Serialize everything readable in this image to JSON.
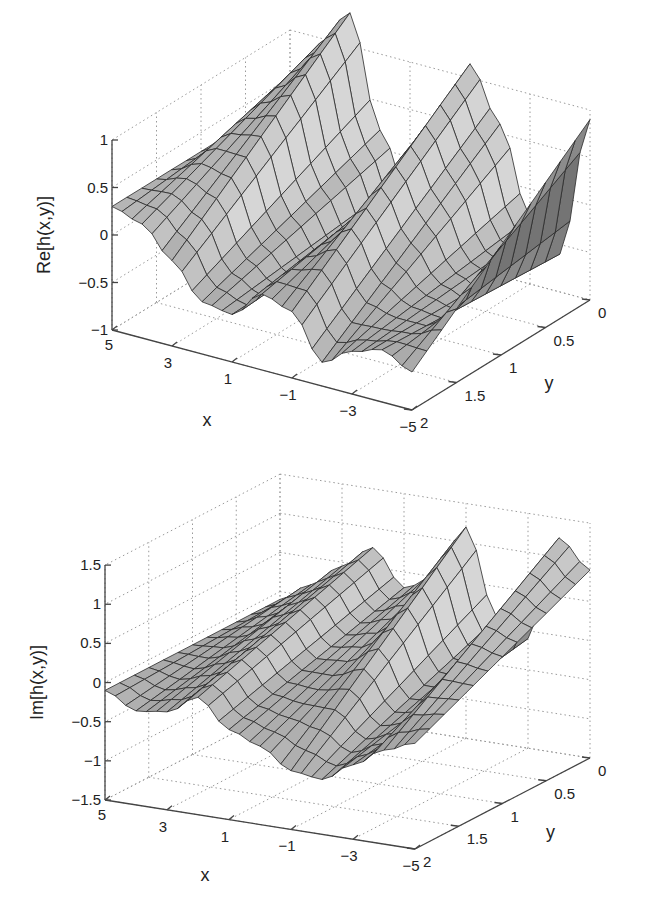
{
  "chart_data": [
    {
      "type": "surface",
      "title": "",
      "xlabel": "x",
      "ylabel": "y",
      "zlabel": "Re[h(x,y)]",
      "xlim": [
        -5,
        5
      ],
      "ylim": [
        0,
        2
      ],
      "zlim": [
        -1,
        1
      ],
      "xticks": [
        5,
        3,
        1,
        -1,
        -3,
        -5
      ],
      "xtick_labels": [
        "5",
        "3",
        "1",
        "−1",
        "−3",
        "−5"
      ],
      "yticks": [
        0,
        0.5,
        1,
        1.5,
        2
      ],
      "ytick_labels": [
        "0",
        "0.5",
        "1",
        "1.5",
        "2"
      ],
      "zticks": [
        -1,
        -0.5,
        0,
        0.5,
        1
      ],
      "ztick_labels": [
        "−1",
        "−0.5",
        "0",
        "0.5",
        "1"
      ],
      "grid": true,
      "shading": "faceted gray mesh",
      "description": "Real part oscillates along x with ridges near x=3.5, x=-1 and x=-5 reaching about 1 at y=0, valleys near x=1.5 and x=-3.5 around -0.5 to -0.8; amplitude decays toward y=2.",
      "surface_samples": {
        "x": [
          5,
          4,
          3,
          2,
          1,
          0,
          -1,
          -2,
          -3,
          -4,
          -5
        ],
        "y0_values": [
          0.3,
          0.95,
          1.35,
          0.2,
          -0.45,
          0.2,
          1.15,
          0.6,
          -0.3,
          -0.6,
          0.9
        ],
        "y2_values": [
          0.3,
          0.2,
          -0.1,
          -0.45,
          -0.5,
          -0.2,
          -0.3,
          -0.75,
          -0.55,
          -0.45,
          -0.6
        ]
      }
    },
    {
      "type": "surface",
      "title": "",
      "xlabel": "x",
      "ylabel": "y",
      "zlabel": "Im[h(x,y)]",
      "xlim": [
        -5,
        5
      ],
      "ylim": [
        0,
        2
      ],
      "zlim": [
        -1.5,
        1.5
      ],
      "xticks": [
        5,
        3,
        1,
        -1,
        -3,
        -5
      ],
      "xtick_labels": [
        "5",
        "3",
        "1",
        "−1",
        "−3",
        "−5"
      ],
      "yticks": [
        0,
        0.5,
        1,
        1.5,
        2
      ],
      "ytick_labels": [
        "0",
        "0.5",
        "1",
        "1.5",
        "2"
      ],
      "zticks": [
        -1.5,
        -1,
        -0.5,
        0,
        0.5,
        1,
        1.5
      ],
      "ztick_labels": [
        "−1.5",
        "−1",
        "−0.5",
        "0",
        "0.5",
        "1",
        "1.5"
      ],
      "grid": true,
      "shading": "faceted gray mesh",
      "description": "Imaginary part is near 0 at the front edge, with ridges near x=2, x=-1 and x=-4 rising to about 1.2 at y=0 and a trough near x=-2.5 around -0.8; amplitude decays toward y=2.",
      "surface_samples": {
        "x": [
          5,
          4,
          3,
          2,
          1,
          0,
          -1,
          -2,
          -3,
          -4,
          -5
        ],
        "y0_values": [
          -0.1,
          0.15,
          0.45,
          0.75,
          0.3,
          0.5,
          1.2,
          0.1,
          -0.1,
          1.25,
          0.9
        ],
        "y2_values": [
          -0.1,
          -0.3,
          -0.25,
          0.0,
          -0.35,
          -0.5,
          -0.75,
          -0.8,
          -0.55,
          -0.3,
          -0.15
        ]
      }
    }
  ],
  "figures": {
    "top": {
      "zlabel": "Re[h(x,y)]",
      "xlabel": "x",
      "ylabel": "y"
    },
    "bottom": {
      "zlabel": "Im[h(x,y)]",
      "xlabel": "x",
      "ylabel": "y"
    }
  },
  "style": {
    "face_light": "#d0d0d0",
    "face_dark": "#7a7a7a",
    "edge": "#2a2a2a",
    "grid": "#9a9a9a",
    "axis": "#444444"
  }
}
